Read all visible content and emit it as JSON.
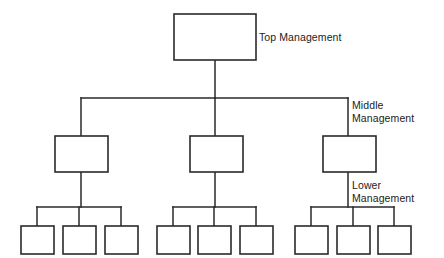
{
  "diagram": {
    "background_color": "#ffffff",
    "line_color": "#2a2a2a",
    "box_fill": "#ffffff",
    "labels": {
      "top": "Top Management",
      "middle": "Middle\nManagement",
      "lower": "Lower\nManagement"
    },
    "levels": [
      {
        "name": "top-management",
        "label": "Top Management",
        "box_count": 1,
        "boxes": [
          {
            "id": "top-1",
            "x": 174,
            "y": 14,
            "w": 82,
            "h": 46,
            "text": ""
          }
        ]
      },
      {
        "name": "middle-management",
        "label": "Middle Management",
        "box_count": 3,
        "boxes": [
          {
            "id": "mid-1",
            "x": 55,
            "y": 136,
            "w": 53,
            "h": 36,
            "text": ""
          },
          {
            "id": "mid-2",
            "x": 190,
            "y": 136,
            "w": 53,
            "h": 36,
            "text": ""
          },
          {
            "id": "mid-3",
            "x": 323,
            "y": 136,
            "w": 53,
            "h": 36,
            "text": ""
          }
        ]
      },
      {
        "name": "lower-management",
        "label": "Lower Management",
        "box_count": 9,
        "boxes": [
          {
            "id": "low-1",
            "x": 21,
            "y": 226,
            "w": 33,
            "h": 28,
            "text": ""
          },
          {
            "id": "low-2",
            "x": 63,
            "y": 226,
            "w": 33,
            "h": 28,
            "text": ""
          },
          {
            "id": "low-3",
            "x": 105,
            "y": 226,
            "w": 33,
            "h": 28,
            "text": ""
          },
          {
            "id": "low-4",
            "x": 157,
            "y": 226,
            "w": 33,
            "h": 28,
            "text": ""
          },
          {
            "id": "low-5",
            "x": 198,
            "y": 226,
            "w": 33,
            "h": 28,
            "text": ""
          },
          {
            "id": "low-6",
            "x": 240,
            "y": 226,
            "w": 33,
            "h": 28,
            "text": ""
          },
          {
            "id": "low-7",
            "x": 295,
            "y": 226,
            "w": 33,
            "h": 28,
            "text": ""
          },
          {
            "id": "low-8",
            "x": 337,
            "y": 226,
            "w": 33,
            "h": 28,
            "text": ""
          },
          {
            "id": "low-9",
            "x": 378,
            "y": 226,
            "w": 33,
            "h": 28,
            "text": ""
          }
        ]
      }
    ],
    "connectors": [
      {
        "id": "top-stem",
        "points": "215,60 215,98"
      },
      {
        "id": "middle-bus",
        "points": "81,98 348,98"
      },
      {
        "id": "middle-drop-1",
        "points": "81,98 81,136"
      },
      {
        "id": "middle-drop-2",
        "points": "215,98 215,136"
      },
      {
        "id": "middle-drop-3",
        "points": "348,98 348,136"
      },
      {
        "id": "mid1-stem",
        "points": "81,172 81,207"
      },
      {
        "id": "mid2-stem",
        "points": "215,172 215,207"
      },
      {
        "id": "mid3-stem",
        "points": "348,172 348,207"
      },
      {
        "id": "lower-bus-1",
        "points": "37,207 121,207"
      },
      {
        "id": "lower-bus-2",
        "points": "173,207 256,207"
      },
      {
        "id": "lower-bus-3",
        "points": "311,207 394,207"
      },
      {
        "id": "lower-drop-1",
        "points": "37,207 37,226"
      },
      {
        "id": "lower-drop-2",
        "points": "79,207 79,226"
      },
      {
        "id": "lower-drop-3",
        "points": "121,207 121,226"
      },
      {
        "id": "lower-drop-4",
        "points": "173,207 173,226"
      },
      {
        "id": "lower-drop-5",
        "points": "214,207 214,226"
      },
      {
        "id": "lower-drop-6",
        "points": "256,207 256,226"
      },
      {
        "id": "lower-drop-7",
        "points": "311,207 311,226"
      },
      {
        "id": "lower-drop-8",
        "points": "353,207 353,226"
      },
      {
        "id": "lower-drop-9",
        "points": "394,207 394,226"
      }
    ]
  }
}
